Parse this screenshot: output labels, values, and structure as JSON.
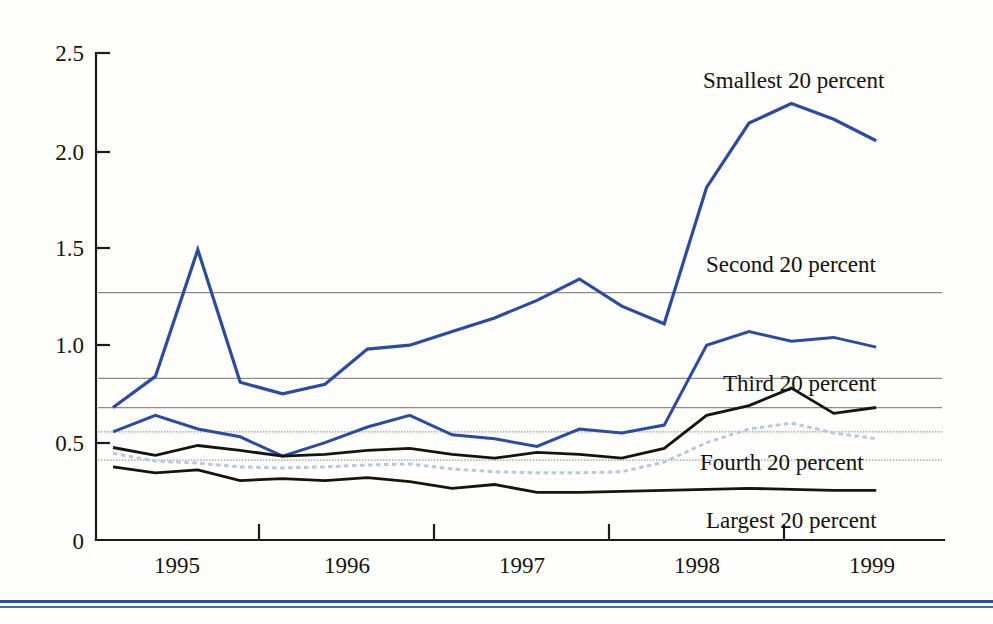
{
  "chart_data": {
    "type": "line",
    "title": "",
    "subtitle": "",
    "xlabel": "",
    "ylabel": "",
    "xlim": [
      1994.5,
      1999.5
    ],
    "ylim": [
      0,
      2.5
    ],
    "grid": true,
    "grid_note": "horizontal reference lines only, no vertical grid",
    "legend_position": "inline-annotations",
    "y_ticks": [
      "0",
      "0.5",
      "1.0",
      "1.5",
      "2.0",
      "2.5"
    ],
    "y_tick_values": [
      0,
      0.5,
      1.0,
      1.5,
      2.0,
      2.5
    ],
    "x_ticks": [
      "1995",
      "1996",
      "1997",
      "1998",
      "1999"
    ],
    "x_tick_values": [
      1995,
      1996,
      1997,
      1998,
      1999
    ],
    "x": [
      1994.6,
      1994.85,
      1995.1,
      1995.35,
      1995.6,
      1995.85,
      1996.1,
      1996.35,
      1996.6,
      1996.85,
      1997.1,
      1997.35,
      1997.6,
      1997.85,
      1998.1,
      1998.35,
      1998.6,
      1998.85,
      1999.1
    ],
    "reference_lines": [
      {
        "label": "Smallest 20 percent mean",
        "value": 1.27
      },
      {
        "label": "Second 20 percent mean",
        "value": 0.83
      },
      {
        "label": "Third 20 percent mean",
        "value": 0.68
      },
      {
        "label": "Fourth 20 percent mean",
        "value": 0.555
      },
      {
        "label": "Largest 20 percent mean",
        "value": 0.41
      }
    ],
    "series": [
      {
        "name": "Smallest 20 percent",
        "color": "#2c4a9e",
        "style": "solid",
        "width": 3.2,
        "values": [
          0.68,
          0.84,
          1.49,
          0.81,
          0.75,
          0.8,
          0.98,
          1.0,
          1.07,
          1.14,
          1.23,
          1.34,
          1.2,
          1.11,
          1.81,
          2.14,
          2.24,
          2.16,
          2.05
        ],
        "label_x": 1998.35,
        "label_y": 2.44
      },
      {
        "name": "Second 20 percent",
        "color": "#2c4a9e",
        "style": "solid",
        "width": 3.0,
        "values": [
          0.555,
          0.64,
          0.57,
          0.53,
          0.43,
          0.5,
          0.58,
          0.64,
          0.54,
          0.52,
          0.48,
          0.57,
          0.55,
          0.59,
          1.0,
          1.07,
          1.02,
          1.04,
          0.99
        ],
        "label_x": 1998.35,
        "label_y": 1.5
      },
      {
        "name": "Third 20 percent",
        "color": "#16140f",
        "style": "solid",
        "width": 2.8,
        "values": [
          0.475,
          0.435,
          0.485,
          0.46,
          0.43,
          0.44,
          0.46,
          0.47,
          0.44,
          0.42,
          0.45,
          0.44,
          0.42,
          0.47,
          0.64,
          0.69,
          0.78,
          0.65,
          0.68
        ],
        "label_x": 1998.1,
        "label_y": 0.86
      },
      {
        "name": "Fourth 20 percent",
        "color": "#b9c9dd",
        "style": "dotted",
        "width": 3.0,
        "values": [
          0.445,
          0.405,
          0.395,
          0.375,
          0.37,
          0.375,
          0.385,
          0.39,
          0.365,
          0.35,
          0.345,
          0.345,
          0.35,
          0.4,
          0.5,
          0.57,
          0.6,
          0.55,
          0.52
        ],
        "label_x": 1998.1,
        "label_y": 0.43
      },
      {
        "name": "Largest 20 percent",
        "color": "#16140f",
        "style": "solid",
        "width": 2.8,
        "values": [
          0.375,
          0.345,
          0.36,
          0.305,
          0.315,
          0.305,
          0.32,
          0.3,
          0.265,
          0.285,
          0.245,
          0.245,
          0.25,
          0.255,
          0.26,
          0.265,
          0.26,
          0.255,
          0.255
        ],
        "label_x": 1998.1,
        "label_y": 0.175
      }
    ]
  },
  "axes": {
    "y_labels": [
      "2.5",
      "2.0",
      "1.5",
      "1.0",
      "0.5",
      "0"
    ],
    "x_labels": [
      "1995",
      "1996",
      "1997",
      "1998",
      "1999"
    ]
  },
  "annotations": {
    "smallest": "Smallest 20 percent",
    "second": "Second 20 percent",
    "third": "Third 20 percent",
    "fourth": "Fourth 20 percent",
    "largest": "Largest 20 percent"
  }
}
